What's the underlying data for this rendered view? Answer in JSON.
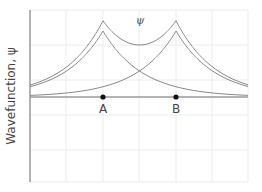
{
  "chart_data": {
    "type": "line",
    "title": "",
    "xlabel": "",
    "ylabel": "Wavefunction, ψ",
    "grid": true,
    "legend": null,
    "annotations": [
      {
        "text": "ψ",
        "x": 140,
        "y": 20,
        "note": "label on combined curve between peaks"
      },
      {
        "text": "A",
        "x": 103,
        "y": 108
      },
      {
        "text": "B",
        "x": 176,
        "y": 108
      }
    ],
    "points": [
      {
        "name": "A",
        "px": 103,
        "py": 97
      },
      {
        "name": "B",
        "px": 176,
        "py": 97
      }
    ],
    "series": [
      {
        "name": "psi_A (orbital centered at A)",
        "description": "cusp peak at A, decays exponentially"
      },
      {
        "name": "psi_B (orbital centered at B)",
        "description": "cusp peak at B, decays exponentially"
      },
      {
        "name": "psi (sum)",
        "description": "sum of psi_A and psi_B; cusps at A and B with dip between"
      }
    ],
    "axis": {
      "x_baseline_px": 97,
      "y_axis_px": 30,
      "plot_left": 30,
      "plot_right": 248,
      "plot_top": 10,
      "plot_bottom": 182
    }
  },
  "labels": {
    "ylabel": "Wavefunction, ψ",
    "psi": "ψ",
    "a": "A",
    "b": "B"
  },
  "colors": {
    "curve": "#8a8a8a",
    "grid": "#ececec",
    "axis": "#9a9a9a",
    "point": "#111111",
    "text": "#444444"
  }
}
